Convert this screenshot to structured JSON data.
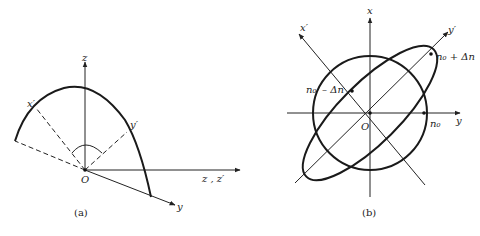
{
  "figure": {
    "panel_a": {
      "caption": "(a)",
      "labels": {
        "z_axis": "z",
        "horizontal_axis": "z , z′",
        "y_axis": "y",
        "x_prime": "x′",
        "y_prime": "y′",
        "origin": "O"
      }
    },
    "panel_b": {
      "caption": "(b)",
      "labels": {
        "x_axis": "x",
        "y_axis": "y",
        "x_prime": "x′",
        "y_prime": "y′",
        "origin": "O",
        "n0_plus": "n₀ + Δn",
        "n0_minus_n": "n₀",
        "n0_minus_delta": "– Δn",
        "n0": "n₀"
      }
    },
    "colors": {
      "stroke": "#1a1a1a",
      "background": "#ffffff"
    }
  }
}
